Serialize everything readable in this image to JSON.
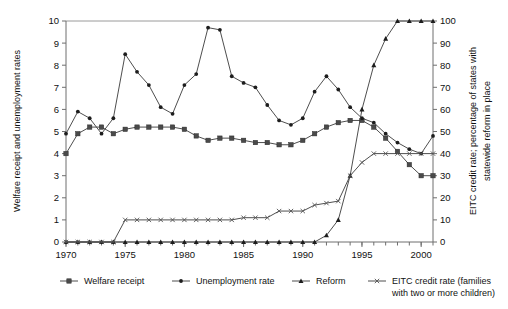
{
  "chart_data": {
    "type": "line",
    "title": "",
    "xlabel": "",
    "ylabel": "Welfare receipt and unemployment rates",
    "y2label": "EITC credit rate; percentage of states with statewide reform in place",
    "x": [
      1970,
      1971,
      1972,
      1973,
      1974,
      1975,
      1976,
      1977,
      1978,
      1979,
      1980,
      1981,
      1982,
      1983,
      1984,
      1985,
      1986,
      1987,
      1988,
      1989,
      1990,
      1991,
      1992,
      1993,
      1994,
      1995,
      1996,
      1997,
      1998,
      1999,
      2000,
      2001
    ],
    "xlim": [
      1970,
      2001
    ],
    "xticks": [
      1970,
      1975,
      1980,
      1985,
      1990,
      1995,
      2000
    ],
    "ylim": [
      0,
      10
    ],
    "yticks": [
      0,
      1,
      2,
      3,
      4,
      5,
      6,
      7,
      8,
      9,
      10
    ],
    "y2lim": [
      0,
      100
    ],
    "y2ticks": [
      0,
      10,
      20,
      30,
      40,
      50,
      60,
      70,
      80,
      90,
      100
    ],
    "grid": false,
    "legend_position": "bottom",
    "series": [
      {
        "name": "Welfare receipt",
        "axis": "left",
        "marker": "square",
        "values": [
          4.0,
          4.9,
          5.2,
          5.2,
          4.9,
          5.1,
          5.2,
          5.2,
          5.2,
          5.2,
          5.1,
          4.8,
          4.6,
          4.7,
          4.7,
          4.6,
          4.5,
          4.5,
          4.4,
          4.4,
          4.6,
          4.9,
          5.2,
          5.4,
          5.5,
          5.5,
          5.2,
          4.7,
          4.1,
          3.5,
          3.0,
          3.0
        ]
      },
      {
        "name": "Unemployment rate",
        "axis": "left",
        "marker": "dot",
        "values": [
          4.9,
          5.9,
          5.6,
          4.9,
          5.6,
          8.5,
          7.7,
          7.1,
          6.1,
          5.8,
          7.1,
          7.6,
          9.7,
          9.6,
          7.5,
          7.2,
          7.0,
          6.2,
          5.5,
          5.3,
          5.6,
          6.8,
          7.5,
          6.9,
          6.1,
          5.6,
          5.4,
          4.9,
          4.5,
          4.2,
          4.0,
          4.8
        ]
      },
      {
        "name": "Reform",
        "axis": "right",
        "marker": "triangle",
        "values": [
          0,
          0,
          0,
          0,
          0,
          0,
          0,
          0,
          0,
          0,
          0,
          0,
          0,
          0,
          0,
          0,
          0,
          0,
          0,
          0,
          0,
          0,
          3,
          10,
          30,
          60,
          80,
          92,
          100,
          100,
          100,
          100
        ]
      },
      {
        "name": "EITC credit rate (families with two or more children)",
        "axis": "right",
        "marker": "x",
        "values": [
          0,
          0,
          0,
          0,
          0,
          10,
          10,
          10,
          10,
          10,
          10,
          10,
          10,
          10,
          10,
          11,
          11,
          11,
          14,
          14,
          14,
          16.7,
          17.6,
          18.5,
          30,
          36,
          40,
          40,
          40,
          40,
          40,
          40
        ]
      }
    ],
    "legend": [
      {
        "label": "Welfare receipt",
        "marker": "square"
      },
      {
        "label": "Unemployment rate",
        "marker": "dot"
      },
      {
        "label": "Reform",
        "marker": "triangle"
      },
      {
        "label": "EITC credit rate (families",
        "label2": "with two or more children)",
        "marker": "x"
      }
    ]
  }
}
